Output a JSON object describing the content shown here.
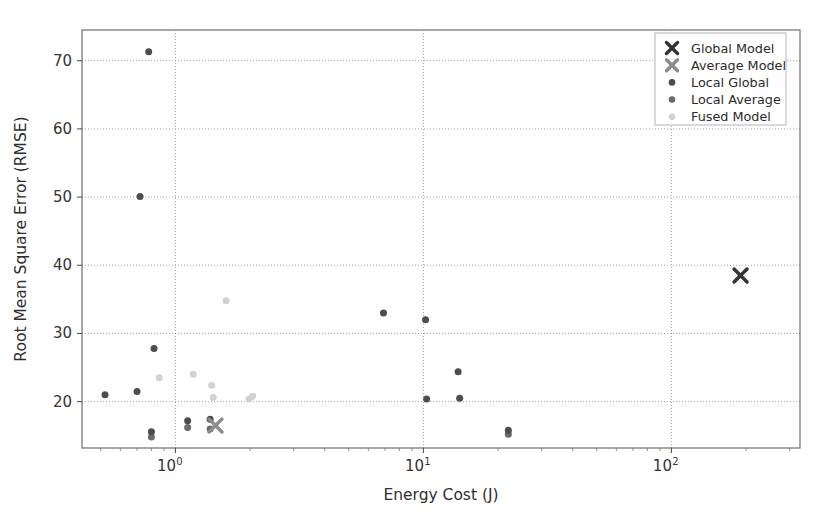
{
  "chart_data": {
    "type": "scatter",
    "title": "",
    "xlabel": "Energy Cost (J)",
    "ylabel": "Root Mean Square Error (RMSE)",
    "xscale": "log",
    "yscale": "linear",
    "xlim": [
      0.42,
      330
    ],
    "ylim": [
      13.2,
      74.5
    ],
    "xticks": [
      "10^0",
      "10^1",
      "10^2"
    ],
    "xtick_values": [
      1,
      10,
      100
    ],
    "xtick_labels": [
      "10",
      "10",
      "10"
    ],
    "xtick_exponents": [
      "0",
      "1",
      "2"
    ],
    "yticks": [
      20,
      30,
      40,
      50,
      60,
      70
    ],
    "ytick_labels": [
      "20",
      "30",
      "40",
      "50",
      "60",
      "70"
    ],
    "grid": true,
    "grid_style": "dotted",
    "legend_position": "upper right",
    "series": [
      {
        "name": "Global Model",
        "marker": "x",
        "color": "#333333",
        "size": 13,
        "points": [
          {
            "x": 190.0,
            "y": 38.5
          }
        ]
      },
      {
        "name": "Average Model",
        "marker": "x",
        "color": "#8c8c8c",
        "size": 13,
        "points": [
          {
            "x": 1.45,
            "y": 16.5
          }
        ]
      },
      {
        "name": "Local Global",
        "marker": "o",
        "color": "#4d4d4d",
        "size": 7,
        "points": [
          {
            "x": 0.78,
            "y": 71.3
          },
          {
            "x": 0.72,
            "y": 50.1
          },
          {
            "x": 0.82,
            "y": 27.8
          },
          {
            "x": 0.52,
            "y": 21.0
          },
          {
            "x": 0.7,
            "y": 21.5
          },
          {
            "x": 1.12,
            "y": 17.2
          },
          {
            "x": 6.9,
            "y": 33.0
          },
          {
            "x": 10.2,
            "y": 32.0
          },
          {
            "x": 10.3,
            "y": 20.4
          },
          {
            "x": 13.8,
            "y": 24.4
          },
          {
            "x": 14.0,
            "y": 20.5
          },
          {
            "x": 22.0,
            "y": 15.8
          },
          {
            "x": 0.8,
            "y": 15.6
          },
          {
            "x": 1.38,
            "y": 17.4
          }
        ]
      },
      {
        "name": "Local Average",
        "marker": "o",
        "color": "#6b6b6b",
        "size": 7,
        "points": [
          {
            "x": 0.8,
            "y": 14.8
          },
          {
            "x": 1.12,
            "y": 16.2
          },
          {
            "x": 1.38,
            "y": 16.0
          },
          {
            "x": 22.0,
            "y": 15.2
          }
        ]
      },
      {
        "name": "Fused Model",
        "marker": "o",
        "color": "#d2d2d2",
        "size": 7,
        "points": [
          {
            "x": 1.6,
            "y": 34.8
          },
          {
            "x": 0.86,
            "y": 23.5
          },
          {
            "x": 1.18,
            "y": 24.0
          },
          {
            "x": 1.4,
            "y": 22.4
          },
          {
            "x": 1.42,
            "y": 20.6
          },
          {
            "x": 1.98,
            "y": 20.4
          },
          {
            "x": 2.05,
            "y": 20.8
          }
        ]
      }
    ]
  }
}
